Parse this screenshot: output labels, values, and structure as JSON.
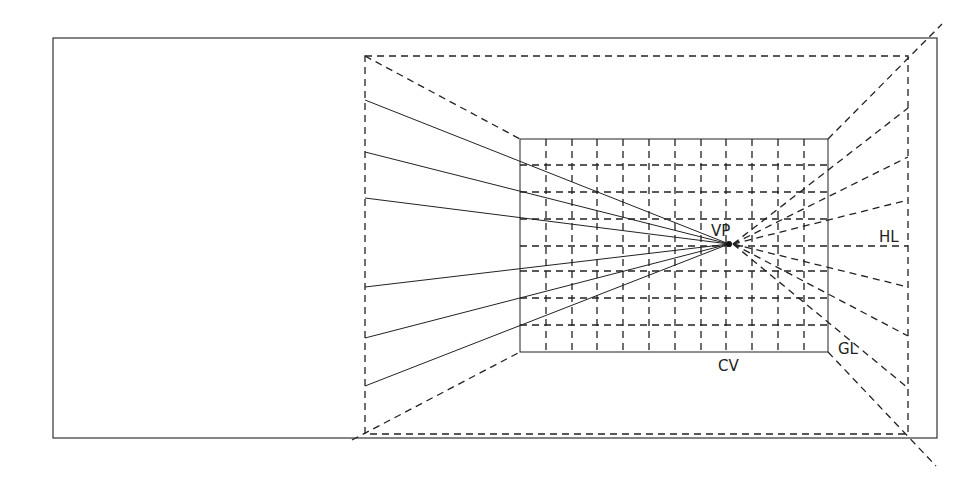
{
  "diagram": {
    "type": "one-point perspective construction",
    "labels": {
      "vp": "VP",
      "hl": "HL",
      "gl": "GL",
      "cv": "CV"
    },
    "colors": {
      "ink": "#222222",
      "background": "#ffffff"
    },
    "geometry": {
      "outer_frame": {
        "x": 53,
        "y": 38,
        "w": 884,
        "h": 400
      },
      "picture_plane_dashed": {
        "x": 365,
        "y": 56,
        "w": 543,
        "h": 378
      },
      "back_wall_solid": {
        "x": 520,
        "y": 139,
        "w": 308,
        "h": 213
      },
      "vanishing_point": {
        "x": 729,
        "y": 244
      },
      "horizon_y": 246,
      "grid_verticals_x": [
        546,
        572,
        597,
        623,
        649,
        675,
        701,
        726,
        752,
        778,
        804
      ],
      "grid_horizontals_y": [
        165,
        192,
        219,
        246,
        271,
        298,
        325
      ],
      "left_solid_rays_y": [
        100,
        152,
        198,
        287,
        338,
        386
      ],
      "right_dashed_rays_y": [
        108,
        157,
        200,
        246,
        287,
        336,
        388
      ],
      "diagonals": [
        {
          "x1": 365,
          "y1": 56,
          "x2": 520,
          "y2": 139
        },
        {
          "x1": 352,
          "y1": 440,
          "x2": 520,
          "y2": 352
        },
        {
          "x1": 828,
          "y1": 139,
          "x2": 942,
          "y2": 24
        },
        {
          "x1": 828,
          "y1": 352,
          "x2": 936,
          "y2": 466
        }
      ]
    }
  }
}
